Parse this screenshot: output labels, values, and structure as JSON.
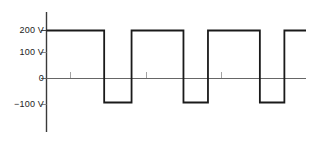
{
  "figure": {
    "width": 309,
    "height": 141,
    "background": "#ffffff"
  },
  "axis": {
    "y_labels": [
      {
        "text": "200 V",
        "value": 200
      },
      {
        "text": "100 V",
        "value": 100
      },
      {
        "text": "0",
        "value": 0
      },
      {
        "text": "−100 V",
        "value": -100
      }
    ],
    "y_axis_color": "#333333",
    "zero_line_color": "#555555",
    "tick_color": "#777777"
  },
  "chart_data": {
    "type": "line",
    "title": "",
    "xlabel": "",
    "ylabel": "",
    "ylim": [
      -160,
      240
    ],
    "xlim": [
      0,
      9
    ],
    "grid": false,
    "legend": null,
    "waveform": "square-wave-bipolar",
    "high_level": 200,
    "low_level": -100,
    "yticks": [
      200,
      100,
      0,
      -100
    ],
    "ytick_labels": [
      "200 V",
      "100 V",
      "0",
      "−100 V"
    ],
    "xticks": [
      1.1,
      4.0,
      6.9
    ],
    "xtick_labels": [
      "",
      "",
      ""
    ],
    "series": [
      {
        "name": "v(t)",
        "color": "#1a1a1a",
        "linewidth": 1.8,
        "points": [
          {
            "x": 0.0,
            "y": 200
          },
          {
            "x": 2.0,
            "y": 200
          },
          {
            "x": 2.0,
            "y": -100
          },
          {
            "x": 2.95,
            "y": -100
          },
          {
            "x": 2.95,
            "y": 200
          },
          {
            "x": 4.75,
            "y": 200
          },
          {
            "x": 4.75,
            "y": -100
          },
          {
            "x": 5.6,
            "y": -100
          },
          {
            "x": 5.6,
            "y": 200
          },
          {
            "x": 7.4,
            "y": 200
          },
          {
            "x": 7.4,
            "y": -100
          },
          {
            "x": 8.25,
            "y": -100
          },
          {
            "x": 8.25,
            "y": 200
          },
          {
            "x": 9.0,
            "y": 200
          }
        ]
      }
    ]
  }
}
